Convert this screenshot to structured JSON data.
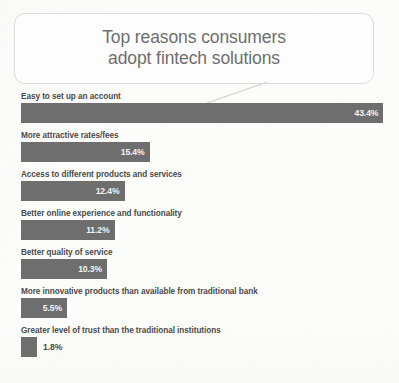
{
  "title": {
    "text": "Top reasons consumers\nadopt fintech solutions"
  },
  "colors": {
    "bar": "#6f6e6e",
    "background": "#fcfcfb",
    "bubble_border": "#dcdcdc",
    "title_text": "#6e6e6e",
    "label_text": "#4a4a4a",
    "value_text_inside": "#f2f2f2",
    "value_text_outside": "#4a4a4a"
  },
  "chart_data": {
    "type": "bar",
    "orientation": "horizontal",
    "title": "Top reasons consumers adopt fintech solutions",
    "xlabel": "",
    "ylabel": "",
    "xlim": [
      0,
      43.4
    ],
    "grid": false,
    "legend": false,
    "value_suffix": "%",
    "categories": [
      "Easy to set up an account",
      "More attractive rates/fees",
      "Access to different products and services",
      "Better online experience and functionality",
      "Better quality of service",
      "More innovative products than available from traditional bank",
      "Greater level of trust than the traditional institutions"
    ],
    "values": [
      43.4,
      15.4,
      12.4,
      11.2,
      10.3,
      5.5,
      1.8
    ],
    "labels": [
      "43.4%",
      "15.4%",
      "12.4%",
      "11.2%",
      "10.3%",
      "5.5%",
      "1.8%"
    ]
  }
}
